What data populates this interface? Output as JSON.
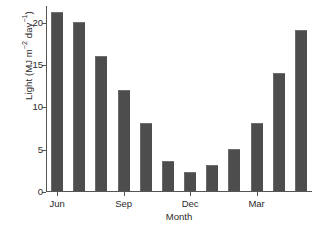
{
  "chart_data": {
    "type": "bar",
    "title": "",
    "xlabel": "Month",
    "ylabel": "Light (MJ m−2 day−1)",
    "ylabel_parts": {
      "prefix": "Light (MJ m",
      "sup1": "−2",
      "mid": " day",
      "sup2": "−1",
      "suffix": ")"
    },
    "categories": [
      "Jun",
      "Jul",
      "Aug",
      "Sep",
      "Oct",
      "Nov",
      "Dec",
      "Jan",
      "Feb",
      "Mar",
      "Apr",
      "May"
    ],
    "values": [
      21.2,
      20.0,
      16.0,
      12.0,
      8.0,
      3.5,
      2.2,
      3.1,
      5.0,
      8.0,
      14.0,
      19.0
    ],
    "ylim": [
      0,
      22
    ],
    "yticks": [
      0,
      5,
      10,
      15,
      20
    ],
    "ytick_labels": [
      "0",
      "5",
      "10",
      "15",
      "20"
    ],
    "xtick_positions": [
      0,
      3,
      6,
      9
    ],
    "xtick_labels": [
      "Jun",
      "Sep",
      "Dec",
      "Mar"
    ],
    "grid": false,
    "legend": false,
    "bar_color": "#4d4d4d",
    "axis_color": "#555555",
    "background": "#ffffff"
  }
}
